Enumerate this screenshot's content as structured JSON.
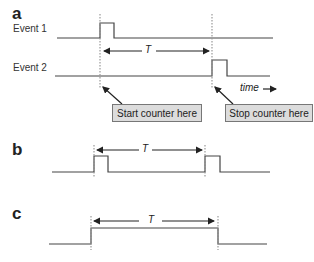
{
  "panels": {
    "a": {
      "label": "a",
      "event1_label": "Event 1",
      "event2_label": "Event 2",
      "period_label": "T",
      "time_label": "time",
      "start_box": "Start counter here",
      "stop_box": "Stop counter here"
    },
    "b": {
      "label": "b",
      "period_label": "T"
    },
    "c": {
      "label": "c",
      "period_label": "T"
    }
  },
  "colors": {
    "line": "#444444",
    "box_fill": "#dcdcdc",
    "box_border": "#777777"
  }
}
